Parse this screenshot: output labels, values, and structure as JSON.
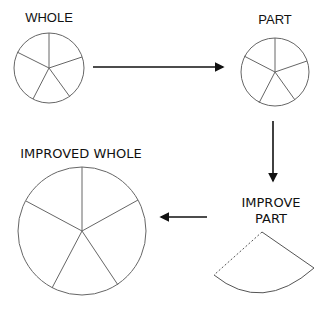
{
  "diagram": {
    "nodes": [
      {
        "id": "whole",
        "label": "WHOLE",
        "segments": 5
      },
      {
        "id": "part",
        "label": "PART",
        "segments": 5
      },
      {
        "id": "improve_part",
        "label_line1": "IMPROVE",
        "label_line2": "PART"
      },
      {
        "id": "improved_whole",
        "label": "IMPROVED WHOLE",
        "segments": 5
      }
    ],
    "edges": [
      {
        "from": "whole",
        "to": "part"
      },
      {
        "from": "part",
        "to": "improve_part"
      },
      {
        "from": "improve_part",
        "to": "improved_whole"
      }
    ],
    "colors": {
      "stroke": "#555555",
      "arrow": "#111111",
      "text": "#111111"
    }
  }
}
